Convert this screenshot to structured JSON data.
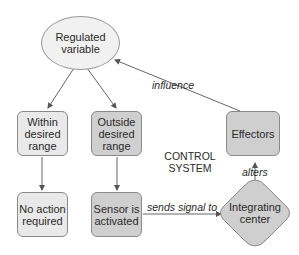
{
  "diagram": {
    "nodes": {
      "regulated_variable": "Regulated variable",
      "within_range": "Within desired range",
      "outside_range": "Outside desired range",
      "no_action": "No action required",
      "sensor_activated": "Sensor is activated",
      "integrating_center": "Integrating center",
      "effectors": "Effectors"
    },
    "edge_labels": {
      "influence": "influence",
      "sends_signal_to": "sends signal to",
      "alters": "alters"
    },
    "caption": {
      "line1": "CONTROL",
      "line2": "SYSTEM"
    },
    "colors": {
      "light_fill": "#e9e9e9",
      "mid_fill": "#cfcfcf",
      "ellipse_fill": "#f1f1f1",
      "stroke": "#8a8a8a",
      "arrow": "#555555"
    }
  }
}
